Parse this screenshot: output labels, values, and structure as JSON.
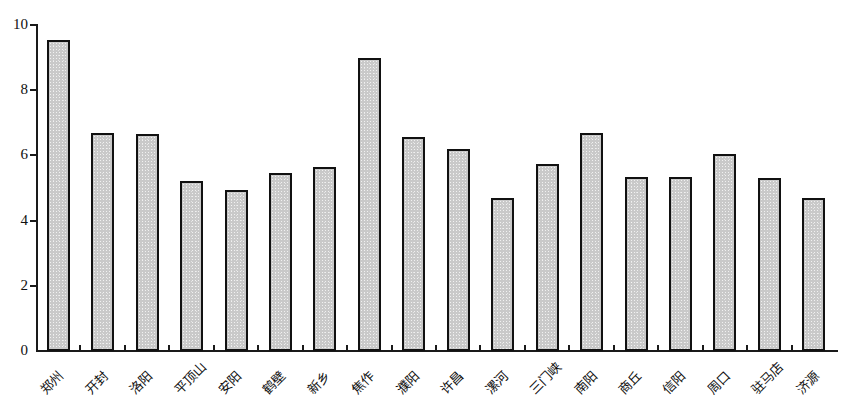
{
  "chart_data": {
    "type": "bar",
    "title": "",
    "subtitle": "",
    "xlabel": "",
    "ylabel": "",
    "ylim": [
      0,
      10
    ],
    "yticks": [
      0,
      2,
      4,
      6,
      8,
      10
    ],
    "grid": false,
    "legend": false,
    "categories": [
      "郑州",
      "开封",
      "洛阳",
      "平顶山",
      "安阳",
      "鹤壁",
      "新乡",
      "焦作",
      "濮阳",
      "许昌",
      "漯河",
      "三门峡",
      "南阳",
      "商丘",
      "信阳",
      "周口",
      "驻马店",
      "济源"
    ],
    "values": [
      9.55,
      6.7,
      6.65,
      5.2,
      4.95,
      5.45,
      5.65,
      9.0,
      6.55,
      6.2,
      4.7,
      5.75,
      6.7,
      5.35,
      5.35,
      6.05,
      5.3,
      4.7
    ],
    "series": [
      {
        "name": "",
        "values": [
          9.55,
          6.7,
          6.65,
          5.2,
          4.95,
          5.45,
          5.65,
          9.0,
          6.55,
          6.2,
          4.7,
          5.75,
          6.7,
          5.35,
          5.35,
          6.05,
          5.3,
          4.7
        ]
      }
    ],
    "annotations": [],
    "colors": {
      "bar_fill": "#c9c9c9",
      "bar_border": "#111111",
      "axis": "#1a1a1a",
      "text": "#101010",
      "background": "#ffffff"
    }
  }
}
